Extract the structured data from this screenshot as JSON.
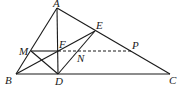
{
  "figure": {
    "points": [
      {
        "name": "A",
        "label": "A"
      },
      {
        "name": "B",
        "label": "B"
      },
      {
        "name": "C",
        "label": "C"
      },
      {
        "name": "D",
        "label": "D"
      },
      {
        "name": "E",
        "label": "E"
      },
      {
        "name": "F",
        "label": "F"
      },
      {
        "name": "M",
        "label": "M"
      },
      {
        "name": "N",
        "label": "N"
      },
      {
        "name": "P",
        "label": "P"
      }
    ],
    "segments_solid": [
      "AB",
      "AC",
      "BC",
      "AD",
      "BE",
      "DE",
      "MD",
      "MF"
    ],
    "segments_dashed": [
      "FP"
    ]
  }
}
